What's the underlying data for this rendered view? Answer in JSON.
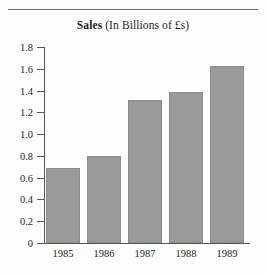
{
  "chart_data": {
    "type": "bar",
    "title": "Sales (In Billions of £s)",
    "title_bold_part": "Sales",
    "title_regular_part": " (In Billions of £s)",
    "categories": [
      "1985",
      "1986",
      "1987",
      "1988",
      "1989"
    ],
    "values": [
      0.69,
      0.8,
      1.31,
      1.39,
      1.63
    ],
    "xlabel": "",
    "ylabel": "",
    "ylim": [
      0,
      1.8
    ],
    "ytick_labels": [
      "1.8",
      "1.6",
      "1.4",
      "1.2",
      "1.0",
      "0.8",
      "0.6",
      "0.4",
      "0.2",
      "0"
    ],
    "ytick_values": [
      1.8,
      1.6,
      1.4,
      1.2,
      1.0,
      0.8,
      0.6,
      0.4,
      0.2,
      0
    ],
    "grid": false,
    "legend": false,
    "bar_color": "#9a9a9a",
    "axis_color": "#55565a",
    "background_color": "#fdfdfc"
  }
}
